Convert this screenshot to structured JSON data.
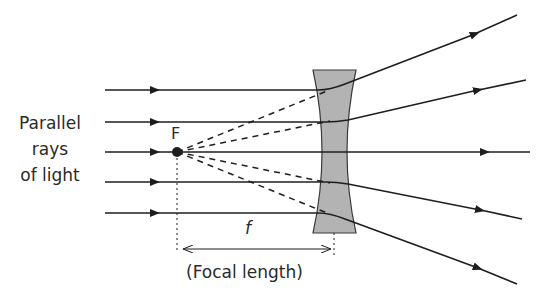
{
  "diagram": {
    "labels": {
      "incoming_line1": "Parallel",
      "incoming_line2": "rays",
      "incoming_line3": "of light",
      "focal_point": "F",
      "focal_symbol": "f",
      "focal_length": "(Focal length)"
    },
    "colors": {
      "line": "#1e1e1e",
      "lens_fill": "#b3b3b3",
      "lens_stroke": "#3a3a3a",
      "text": "#2a2a2a"
    },
    "rays": [
      {
        "y": 90,
        "exit_to": [
          517,
          15
        ]
      },
      {
        "y": 122,
        "exit_to": [
          526,
          80
        ]
      },
      {
        "y": 152,
        "exit_to": [
          530,
          152
        ]
      },
      {
        "y": 182,
        "exit_to": [
          522,
          219
        ]
      },
      {
        "y": 213,
        "exit_to": [
          517,
          284
        ]
      }
    ]
  }
}
